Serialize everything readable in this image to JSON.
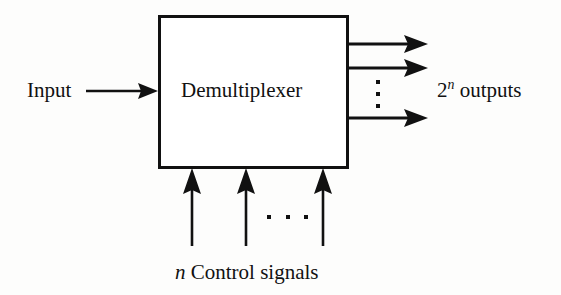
{
  "diagram": {
    "background_color": "#fdfdfc",
    "stroke_color": "#111111",
    "block": {
      "label": "Demultiplexer",
      "x": 158,
      "y": 15,
      "width": 190,
      "height": 153,
      "border_width": 3,
      "fill": "#ffffff"
    },
    "input": {
      "label": "Input",
      "arrow": {
        "x1": 86,
        "y1": 91,
        "x2": 158,
        "y2": 91
      }
    },
    "outputs": {
      "label_prefix": "2",
      "label_exponent": "n",
      "label_suffix": " outputs",
      "count_text": "2n outputs",
      "arrows": [
        {
          "x1": 348,
          "y1": 44,
          "x2": 424,
          "y2": 44
        },
        {
          "x1": 348,
          "y1": 68,
          "x2": 424,
          "y2": 68
        },
        {
          "x1": 348,
          "y1": 118,
          "x2": 424,
          "y2": 118
        }
      ],
      "ellipsis": {
        "orientation": "vertical",
        "dots": 3,
        "x": 378,
        "y_start": 81,
        "y_step": 12
      }
    },
    "control": {
      "label_prefix": "n",
      "label_suffix": " Control signals",
      "label_text": "n Control signals",
      "arrows": [
        {
          "x1": 192,
          "y1": 246,
          "x2": 192,
          "y2": 168
        },
        {
          "x1": 246,
          "y1": 246,
          "x2": 246,
          "y2": 168
        },
        {
          "x1": 323,
          "y1": 246,
          "x2": 323,
          "y2": 168
        }
      ],
      "ellipsis": {
        "orientation": "horizontal",
        "dots": 3,
        "y": 217,
        "x_start": 269,
        "x_step": 18
      }
    }
  }
}
